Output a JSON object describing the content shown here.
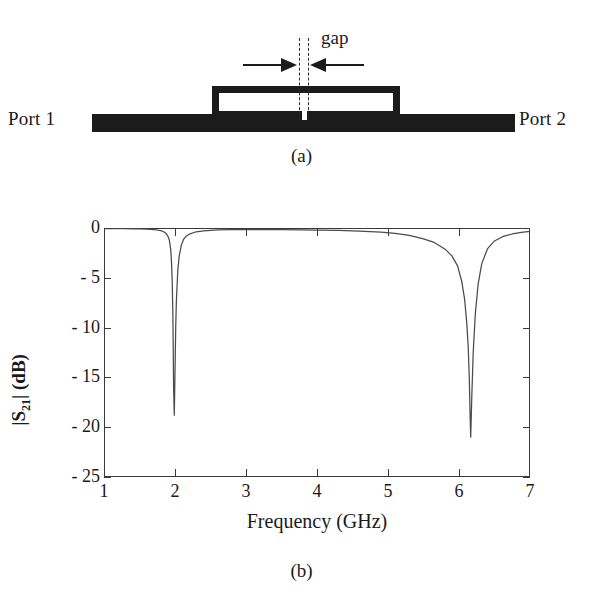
{
  "figure": {
    "panel_a": {
      "caption": "(a)",
      "port1_label": "Port 1",
      "port2_label": "Port 2",
      "gap_label": "gap",
      "ink_color": "#1b1b1b",
      "description": "Microstrip through line with rectangular open-loop resonator coupled above it; a small gap in the resonator is marked by dashed lines and inward arrows."
    },
    "panel_b": {
      "caption": "(b)"
    }
  },
  "chart_data": {
    "type": "line",
    "title": "",
    "xlabel": "Frequency (GHz)",
    "ylabel": "|S21| (dB)",
    "ylabel_parts": {
      "prefix": "|S",
      "sub": "21",
      "suffix": "| (dB)"
    },
    "xlim": [
      1,
      7
    ],
    "ylim": [
      -25,
      0
    ],
    "xticks": [
      1,
      2,
      3,
      4,
      5,
      6,
      7
    ],
    "xtick_labels": [
      "1",
      "2",
      "3",
      "4",
      "5",
      "6",
      "7"
    ],
    "yticks": [
      0,
      -5,
      -10,
      -15,
      -20,
      -25
    ],
    "ytick_labels": [
      "0",
      "- 5",
      "- 10",
      "- 15",
      "- 20",
      "- 25"
    ],
    "grid": false,
    "legend": null,
    "line_color": "#4a4a4a",
    "series": [
      {
        "name": "|S21|",
        "x": [
          1.0,
          1.1,
          1.2,
          1.3,
          1.4,
          1.5,
          1.6,
          1.7,
          1.75,
          1.8,
          1.84,
          1.87,
          1.9,
          1.92,
          1.94,
          1.95,
          1.96,
          1.97,
          1.975,
          1.98,
          1.99,
          2.0,
          2.01,
          2.02,
          2.04,
          2.06,
          2.09,
          2.12,
          2.16,
          2.2,
          2.3,
          2.4,
          2.6,
          2.8,
          3.0,
          3.2,
          3.5,
          3.8,
          4.0,
          4.3,
          4.6,
          4.9,
          5.1,
          5.3,
          5.5,
          5.65,
          5.8,
          5.9,
          5.98,
          6.04,
          6.08,
          6.11,
          6.13,
          6.145,
          6.155,
          6.165,
          6.18,
          6.2,
          6.23,
          6.27,
          6.32,
          6.4,
          6.5,
          6.62,
          6.75,
          6.88,
          7.0
        ],
        "y": [
          -0.06,
          -0.06,
          -0.07,
          -0.07,
          -0.08,
          -0.09,
          -0.11,
          -0.16,
          -0.2,
          -0.27,
          -0.38,
          -0.52,
          -0.82,
          -1.2,
          -2.2,
          -3.3,
          -5.2,
          -8.6,
          -12.0,
          -16.0,
          -18.8,
          -14.5,
          -10.0,
          -7.2,
          -4.2,
          -2.8,
          -1.7,
          -1.15,
          -0.8,
          -0.62,
          -0.38,
          -0.28,
          -0.2,
          -0.17,
          -0.16,
          -0.16,
          -0.17,
          -0.19,
          -0.21,
          -0.25,
          -0.31,
          -0.42,
          -0.55,
          -0.75,
          -1.1,
          -1.45,
          -2.1,
          -2.8,
          -3.8,
          -5.4,
          -7.2,
          -9.6,
          -12.0,
          -15.0,
          -18.5,
          -21.0,
          -17.0,
          -12.5,
          -8.6,
          -5.6,
          -3.6,
          -2.1,
          -1.3,
          -0.85,
          -0.6,
          -0.45,
          -0.35
        ]
      }
    ],
    "annotations": [
      {
        "text": "resonance notch 1",
        "x": 1.99,
        "y": -18.8
      },
      {
        "text": "resonance notch 2",
        "x": 6.165,
        "y": -21.0
      }
    ]
  }
}
